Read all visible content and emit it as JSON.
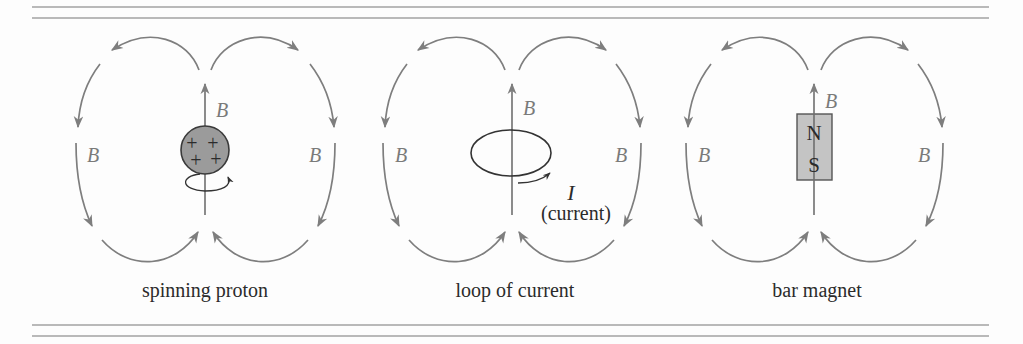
{
  "figures": [
    {
      "id": "spinning-proton",
      "caption": "spinning proton",
      "axis_label": "B",
      "left_label": "B",
      "right_label": "B",
      "charges": [
        "+",
        "+",
        "+",
        "+"
      ]
    },
    {
      "id": "loop-of-current",
      "caption": "loop of current",
      "axis_label": "B",
      "left_label": "B",
      "right_label": "B",
      "current_symbol": "I",
      "current_text": "(current)"
    },
    {
      "id": "bar-magnet",
      "caption": "bar magnet",
      "axis_label": "B",
      "left_label": "B",
      "right_label": "B",
      "north": "N",
      "south": "S"
    }
  ],
  "colors": {
    "field_lines": "#7e7e7e",
    "rules": "#b9b9b9",
    "proton_fill": "#9b9b9b",
    "magnet_fill": "#c4c4c4",
    "text": "#2b2b2b"
  }
}
